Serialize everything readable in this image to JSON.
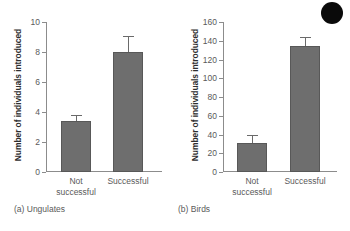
{
  "figure": {
    "artifact": "black-circle-blob"
  },
  "chart_data": [
    {
      "type": "bar",
      "panel_id": "a",
      "caption": "(a) Ungulates",
      "title": "",
      "xlabel": "",
      "ylabel": "Number of individuals introduced",
      "categories": [
        "Not\nsuccessful",
        "Successful"
      ],
      "values": [
        3.4,
        8.0
      ],
      "errors": [
        0.35,
        1.0
      ],
      "ylim": [
        0,
        10
      ],
      "yticks": [
        0,
        2,
        4,
        6,
        8,
        10
      ],
      "ytick_labels": [
        "0",
        "2",
        "4",
        "6",
        "8",
        "10"
      ],
      "grid": false,
      "legend": "none",
      "bar_color": "#6e6e6e"
    },
    {
      "type": "bar",
      "panel_id": "b",
      "caption": "(b) Birds",
      "title": "",
      "xlabel": "",
      "ylabel": "Number of individuals introduced",
      "categories": [
        "Not\nsuccessful",
        "Successful"
      ],
      "values": [
        31,
        134
      ],
      "errors": [
        7,
        9
      ],
      "ylim": [
        0,
        160
      ],
      "yticks": [
        0,
        20,
        40,
        60,
        80,
        100,
        120,
        140,
        160
      ],
      "ytick_labels": [
        "0",
        "20",
        "40",
        "60",
        "80",
        "100",
        "120",
        "140",
        "160"
      ],
      "grid": false,
      "legend": "none",
      "bar_color": "#6e6e6e"
    }
  ]
}
